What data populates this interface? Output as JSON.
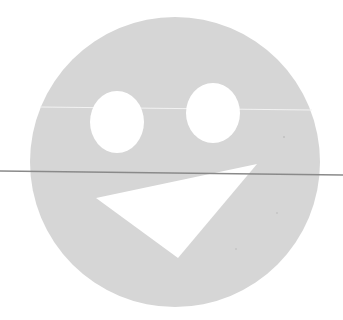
{
  "figure": {
    "background": "#ffffff",
    "face": {
      "shape": "circle",
      "cx": 175,
      "cy": 162,
      "r": 145,
      "fill": "#d6d6d6"
    },
    "left_eye": {
      "shape": "ellipse",
      "cx": 117,
      "cy": 122,
      "rx": 27,
      "ry": 31,
      "fill": "#ffffff"
    },
    "right_eye": {
      "shape": "ellipse",
      "cx": 213,
      "cy": 113,
      "rx": 27,
      "ry": 30,
      "fill": "#ffffff"
    },
    "mouth": {
      "shape": "triangle",
      "points": "96,198 257,164 178,258",
      "fill": "#ffffff"
    },
    "scan_line_light": {
      "x1": 40,
      "y1": 107,
      "x2": 312,
      "y2": 110,
      "stroke": "#f2f2f2"
    },
    "scan_line_dark": {
      "x1": 0,
      "y1": 171,
      "x2": 343,
      "y2": 175,
      "stroke": "#8a8a8a"
    }
  }
}
